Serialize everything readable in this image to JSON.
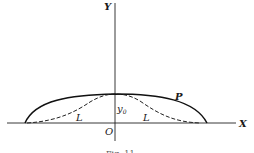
{
  "figure": {
    "axes": {
      "x_label": "X",
      "y_label": "Y",
      "origin_label": "O"
    },
    "curves": [
      {
        "name": "P",
        "style": "solid",
        "label": "P"
      },
      {
        "name": "L",
        "style": "dashed",
        "label_left": "L",
        "label_right": "L"
      }
    ],
    "peak_label": "y",
    "peak_label_subscript": "0",
    "caption": "Fig. 11"
  }
}
